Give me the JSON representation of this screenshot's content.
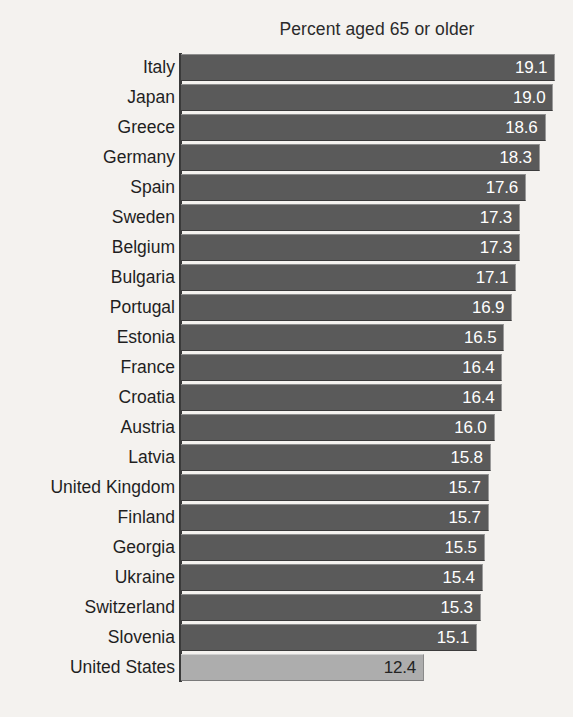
{
  "chart_data": {
    "type": "bar",
    "orientation": "horizontal",
    "title": "Percent aged 65 or older",
    "xlabel": "",
    "ylabel": "",
    "xlim": [
      0,
      19.1
    ],
    "grid": false,
    "legend": null,
    "sorted": "descending",
    "value_format": "one-decimal",
    "categories": [
      "Italy",
      "Japan",
      "Greece",
      "Germany",
      "Spain",
      "Sweden",
      "Belgium",
      "Bulgaria",
      "Portugal",
      "Estonia",
      "France",
      "Croatia",
      "Austria",
      "Latvia",
      "United Kingdom",
      "Finland",
      "Georgia",
      "Ukraine",
      "Switzerland",
      "Slovenia",
      "United States"
    ],
    "values": [
      19.1,
      19.0,
      18.6,
      18.3,
      17.6,
      17.3,
      17.3,
      17.1,
      16.9,
      16.5,
      16.4,
      16.4,
      16.0,
      15.8,
      15.7,
      15.7,
      15.5,
      15.4,
      15.3,
      15.1,
      12.4
    ],
    "value_labels": [
      "19.1",
      "19.0",
      "18.6",
      "18.3",
      "17.6",
      "17.3",
      "17.3",
      "17.1",
      "16.9",
      "16.5",
      "16.4",
      "16.4",
      "16.0",
      "15.8",
      "15.7",
      "15.7",
      "15.5",
      "15.4",
      "15.3",
      "15.1",
      "12.4"
    ],
    "highlighted_category": "United States",
    "colors": {
      "bar": "#5a5a5a",
      "bar_highlight": "#adadad",
      "bar_value_text": "#ffffff",
      "bar_highlight_value_text": "#232323",
      "axis": "#3a3a3a",
      "label_text": "#1f1f1f",
      "title_text": "#2b2b2b",
      "background": "#f4f2ef"
    }
  }
}
